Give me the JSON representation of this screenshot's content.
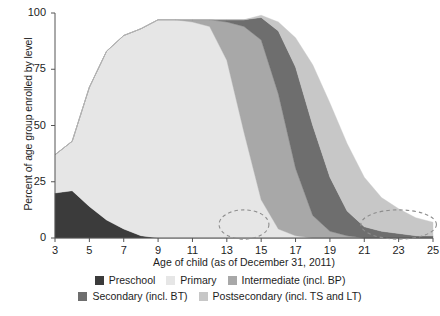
{
  "chart_data": {
    "type": "area",
    "stacked": true,
    "title": "",
    "subtitle": "",
    "xlabel": "Age of child (as of December 31, 2011)",
    "ylabel": "Percent of age group enrolled by level",
    "xlim": [
      3,
      25
    ],
    "ylim": [
      0,
      100
    ],
    "grid": false,
    "legend_position": "bottom",
    "xticks": [
      3,
      5,
      7,
      9,
      11,
      13,
      15,
      17,
      19,
      21,
      23,
      25
    ],
    "yticks": [
      0,
      25,
      50,
      75,
      100
    ],
    "x": [
      3,
      4,
      5,
      6,
      7,
      8,
      9,
      10,
      11,
      12,
      13,
      14,
      15,
      16,
      17,
      18,
      19,
      20,
      21,
      22,
      23,
      24,
      25
    ],
    "series": [
      {
        "name": "Preschool",
        "color": "#3b3b3b",
        "values": [
          20,
          21,
          14,
          8,
          4,
          1,
          0,
          0,
          0,
          0,
          0,
          0,
          0,
          0,
          0,
          0,
          0,
          0,
          0,
          0,
          0,
          0,
          0
        ]
      },
      {
        "name": "Primary",
        "color": "#e6e6e6",
        "values": [
          17,
          22,
          53,
          75,
          86,
          92,
          97,
          97,
          96,
          94,
          79,
          47,
          17,
          4,
          1,
          0,
          0,
          0,
          0,
          0,
          0,
          0,
          0
        ]
      },
      {
        "name": "Intermediate (incl. BP)",
        "color": "#a8a8a8",
        "values": [
          0,
          0,
          0,
          0,
          0,
          0,
          0,
          0,
          1,
          3,
          17,
          47,
          71,
          60,
          30,
          10,
          3,
          1,
          0,
          0,
          0,
          0,
          0
        ]
      },
      {
        "name": "Secondary (incl. BT)",
        "color": "#6e6e6e",
        "values": [
          0,
          0,
          0,
          0,
          0,
          0,
          0,
          0,
          0,
          0,
          1,
          3,
          10,
          28,
          45,
          40,
          24,
          11,
          5,
          3,
          2,
          1,
          1
        ]
      },
      {
        "name": "Postsecondary (incl. TS and LT)",
        "color": "#c7c7c7",
        "values": [
          0,
          0,
          0,
          0,
          0,
          0,
          0,
          0,
          0,
          0,
          0,
          0,
          1,
          4,
          13,
          27,
          33,
          30,
          22,
          15,
          11,
          8,
          6
        ]
      }
    ],
    "annotations": [
      {
        "name": "ellipse-transition-primary-intermediate",
        "cx": 14,
        "cy": 6,
        "rx": 1.45,
        "ry": 6.5,
        "style": "dashed"
      },
      {
        "name": "ellipse-transition-postsecondary",
        "cx": 23,
        "cy": 6,
        "rx": 2.2,
        "ry": 6.5,
        "style": "dashed"
      }
    ]
  },
  "axes": {
    "y_title": "Percent of age group enrolled by level",
    "x_title": "Age of child (as of December 31, 2011)",
    "y_tick_labels": [
      "100",
      "75",
      "50",
      "25",
      "0"
    ],
    "x_tick_labels": [
      "3",
      "5",
      "7",
      "9",
      "11",
      "13",
      "15",
      "17",
      "19",
      "21",
      "23",
      "25"
    ]
  },
  "legend": {
    "rows": [
      [
        {
          "label": "Preschool",
          "color": "#3b3b3b"
        },
        {
          "label": "Primary",
          "color": "#e6e6e6"
        },
        {
          "label": "Intermediate (incl. BP)",
          "color": "#a8a8a8"
        }
      ],
      [
        {
          "label": "Secondary (incl. BT)",
          "color": "#6e6e6e"
        },
        {
          "label": "Postsecondary (incl. TS and LT)",
          "color": "#c7c7c7"
        }
      ]
    ]
  },
  "colors": {
    "axis": "#555555",
    "text": "#1d1d1d",
    "annotation": "#8d8d8d",
    "background": "#ffffff"
  }
}
